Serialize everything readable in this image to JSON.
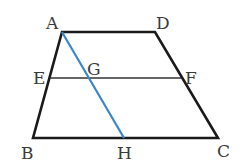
{
  "figure": {
    "type": "trapezoid",
    "colors": {
      "outline": "#1a1a1a",
      "midline": "#333333",
      "segment_AH": "#3a86c8",
      "label": "#3a3a3a"
    },
    "points": {
      "A": {
        "label": "A",
        "x": 62,
        "y": 32
      },
      "D": {
        "label": "D",
        "x": 155,
        "y": 32
      },
      "E": {
        "label": "E",
        "x": 50,
        "y": 78
      },
      "G": {
        "label": "G",
        "x": 88,
        "y": 78
      },
      "F": {
        "label": "F",
        "x": 181,
        "y": 78
      },
      "B": {
        "label": "B",
        "x": 33,
        "y": 138
      },
      "H": {
        "label": "H",
        "x": 124,
        "y": 138
      },
      "C": {
        "label": "C",
        "x": 218,
        "y": 138
      }
    },
    "segments": [
      "AD",
      "DC",
      "CB",
      "BA",
      "EF",
      "AH"
    ]
  }
}
